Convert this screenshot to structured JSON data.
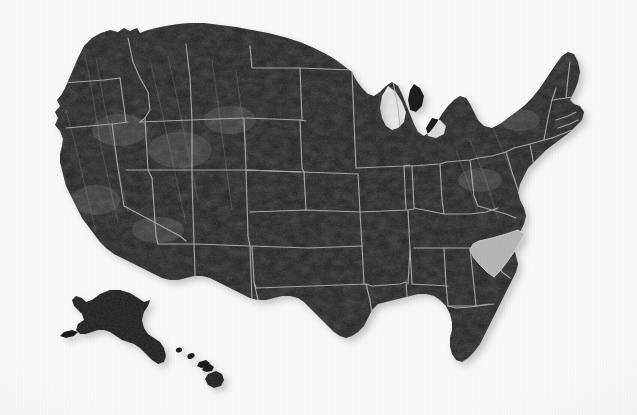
{
  "figure": {
    "name": "united-states-relief-map",
    "kind": "map",
    "width": 637,
    "height": 415,
    "has_text_labels": false,
    "has_legend": false,
    "has_ui_chrome": false
  },
  "colors": {
    "background": "#f8f8f8",
    "land_fill": "#1e1e1e",
    "land_fill_dark": "#141414",
    "relief_highlight": "#5a5a5a",
    "state_border": "#b0b0b0",
    "highlight_fill": "#b5b5b5",
    "highlight_border": "#d2d2d2",
    "shadow": "rgba(120,120,120,0.38)"
  },
  "highlight": {
    "state_name": "South Carolina",
    "state_code": "SC",
    "is_highlighted": true,
    "fill": "#b5b5b5"
  },
  "insets": [
    {
      "name": "alaska",
      "label": "Alaska",
      "position": "lower-left"
    },
    {
      "name": "hawaii",
      "label": "Hawaii",
      "position": "lower-left-center"
    }
  ],
  "regions": [
    {
      "code": "WA",
      "name": "Washington"
    },
    {
      "code": "OR",
      "name": "Oregon"
    },
    {
      "code": "CA",
      "name": "California"
    },
    {
      "code": "NV",
      "name": "Nevada"
    },
    {
      "code": "ID",
      "name": "Idaho"
    },
    {
      "code": "MT",
      "name": "Montana"
    },
    {
      "code": "WY",
      "name": "Wyoming"
    },
    {
      "code": "UT",
      "name": "Utah"
    },
    {
      "code": "AZ",
      "name": "Arizona"
    },
    {
      "code": "CO",
      "name": "Colorado"
    },
    {
      "code": "NM",
      "name": "New Mexico"
    },
    {
      "code": "ND",
      "name": "North Dakota"
    },
    {
      "code": "SD",
      "name": "South Dakota"
    },
    {
      "code": "NE",
      "name": "Nebraska"
    },
    {
      "code": "KS",
      "name": "Kansas"
    },
    {
      "code": "OK",
      "name": "Oklahoma"
    },
    {
      "code": "TX",
      "name": "Texas"
    },
    {
      "code": "MN",
      "name": "Minnesota"
    },
    {
      "code": "IA",
      "name": "Iowa"
    },
    {
      "code": "MO",
      "name": "Missouri"
    },
    {
      "code": "AR",
      "name": "Arkansas"
    },
    {
      "code": "LA",
      "name": "Louisiana"
    },
    {
      "code": "WI",
      "name": "Wisconsin"
    },
    {
      "code": "IL",
      "name": "Illinois"
    },
    {
      "code": "MI",
      "name": "Michigan"
    },
    {
      "code": "IN",
      "name": "Indiana"
    },
    {
      "code": "OH",
      "name": "Ohio"
    },
    {
      "code": "KY",
      "name": "Kentucky"
    },
    {
      "code": "TN",
      "name": "Tennessee"
    },
    {
      "code": "MS",
      "name": "Mississippi"
    },
    {
      "code": "AL",
      "name": "Alabama"
    },
    {
      "code": "GA",
      "name": "Georgia"
    },
    {
      "code": "FL",
      "name": "Florida"
    },
    {
      "code": "SC",
      "name": "South Carolina"
    },
    {
      "code": "NC",
      "name": "North Carolina"
    },
    {
      "code": "VA",
      "name": "Virginia"
    },
    {
      "code": "WV",
      "name": "West Virginia"
    },
    {
      "code": "MD",
      "name": "Maryland"
    },
    {
      "code": "DE",
      "name": "Delaware"
    },
    {
      "code": "PA",
      "name": "Pennsylvania"
    },
    {
      "code": "NJ",
      "name": "New Jersey"
    },
    {
      "code": "NY",
      "name": "New York"
    },
    {
      "code": "CT",
      "name": "Connecticut"
    },
    {
      "code": "RI",
      "name": "Rhode Island"
    },
    {
      "code": "MA",
      "name": "Massachusetts"
    },
    {
      "code": "VT",
      "name": "Vermont"
    },
    {
      "code": "NH",
      "name": "New Hampshire"
    },
    {
      "code": "ME",
      "name": "Maine"
    },
    {
      "code": "AK",
      "name": "Alaska"
    },
    {
      "code": "HI",
      "name": "Hawaii"
    }
  ]
}
